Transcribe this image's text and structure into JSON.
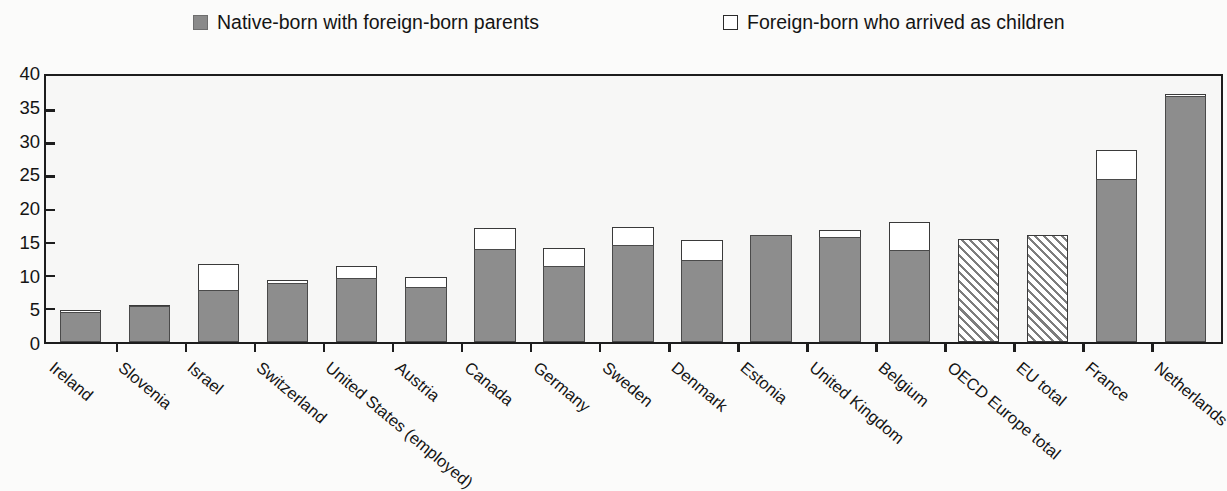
{
  "legend": {
    "items": [
      {
        "label": "Native-born with foreign-born parents",
        "swatch": "filled-square-icon",
        "color": "#8a8a8a"
      },
      {
        "label": "Foreign-born who arrived as children",
        "swatch": "hollow-square-icon",
        "color": "#ffffff"
      }
    ]
  },
  "axis": {
    "y_ticks": [
      "0",
      "5",
      "10",
      "15",
      "20",
      "25",
      "30",
      "35",
      "40"
    ]
  },
  "chart_data": {
    "type": "bar",
    "title": "",
    "subtitle": "",
    "xlabel": "",
    "ylabel": "",
    "ylim": [
      0,
      40
    ],
    "ytick_step": 5,
    "grid": false,
    "stacked": true,
    "legend_position": "top",
    "categories": [
      "Ireland",
      "Slovenia",
      "Israel",
      "Switzerland",
      "United States (employed)",
      "Austria",
      "Canada",
      "Germany",
      "Sweden",
      "Denmark",
      "Estonia",
      "United Kingdom",
      "Belgium",
      "OECD Europe total",
      "EU total",
      "France",
      "Netherlands"
    ],
    "series": [
      {
        "name": "Native-born with foreign-born parents",
        "color": "#8d8d8d",
        "values": [
          4.5,
          5.5,
          7.9,
          8.9,
          9.7,
          8.3,
          14.0,
          11.5,
          14.6,
          12.4,
          16.1,
          15.8,
          13.9,
          null,
          null,
          24.6,
          37.2
        ]
      },
      {
        "name": "Foreign-born who arrived as children",
        "color": "#ffffff",
        "values": [
          0.3,
          0.1,
          3.9,
          0.4,
          1.7,
          1.5,
          3.2,
          2.7,
          2.7,
          3.0,
          0.0,
          1.1,
          4.2,
          null,
          null,
          4.4,
          0.2
        ]
      }
    ],
    "totals": [
      4.8,
      5.6,
      11.8,
      9.3,
      11.4,
      9.8,
      17.2,
      14.2,
      17.3,
      15.4,
      16.1,
      16.9,
      18.1,
      15.5,
      16.1,
      29.0,
      37.4
    ],
    "hatched_categories": [
      "OECD Europe total",
      "EU total"
    ]
  }
}
